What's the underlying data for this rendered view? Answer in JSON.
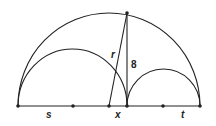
{
  "diagram": {
    "type": "geometry-semicircles",
    "baseline_y": 106,
    "points": {
      "left_end": {
        "x": 18,
        "y": 106
      },
      "s_center": {
        "x": 73,
        "y": 106
      },
      "big_center": {
        "x": 109,
        "y": 106
      },
      "split": {
        "x": 127,
        "y": 106
      },
      "t_center": {
        "x": 163,
        "y": 106
      },
      "right_end": {
        "x": 200,
        "y": 106
      },
      "top": {
        "x": 127,
        "y": 13
      }
    },
    "labels": {
      "s": "s",
      "x": "x",
      "t": "t",
      "r": "r",
      "height": "8"
    },
    "stroke_color": "#222222"
  }
}
